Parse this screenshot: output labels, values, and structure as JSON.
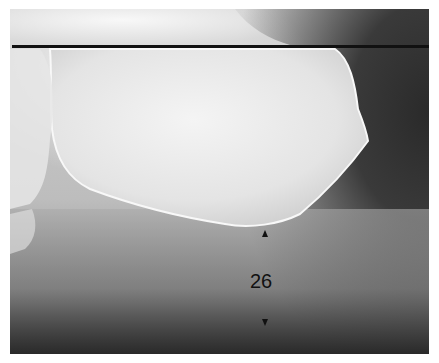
{
  "image": {
    "subject": "lateral radiograph of calcaneus (heel) with heel pad thickness measurement",
    "measurement_label": "26",
    "colors": {
      "reference_line": "#111111",
      "bone": "#f2f2f2",
      "soft_tissue": "#9a9a9a",
      "background_dark": "#2e2e2e"
    }
  }
}
